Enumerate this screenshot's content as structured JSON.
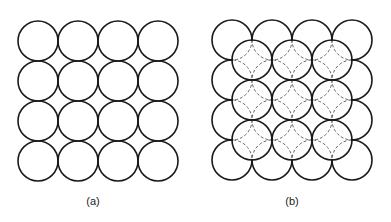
{
  "figure": {
    "panels": [
      {
        "id": "a",
        "label": "(a)",
        "description": "Square packing of circles, single layer",
        "grid": {
          "rows": 4,
          "cols": 4
        },
        "origin": [
          18,
          21
        ],
        "radius": 20,
        "pitch": 40
      },
      {
        "id": "b",
        "label": "(b)",
        "description": "Square packing with second layer of 3x3 circles over hollows; hidden lower-layer arcs dashed",
        "grid": {
          "rows": 4,
          "cols": 4
        },
        "upper_grid": {
          "rows": 3,
          "cols": 3
        },
        "origin": [
          212,
          20
        ],
        "radius": 20,
        "pitch": 40
      }
    ],
    "colors": {
      "stroke": "#1a1a1a",
      "dashed_stroke": "#555555",
      "background": "#ffffff"
    }
  }
}
